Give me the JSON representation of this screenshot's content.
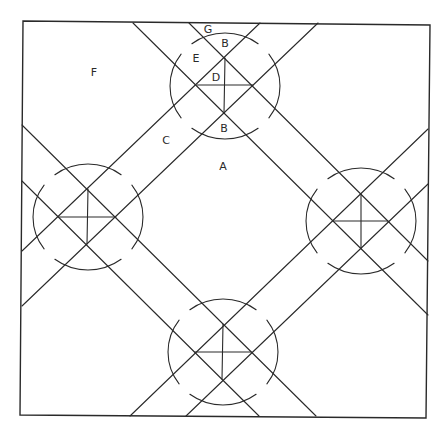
{
  "diagram": {
    "type": "quilt-block-pattern",
    "frame": [
      [
        23,
        21
      ],
      [
        430,
        25
      ],
      [
        426,
        418
      ],
      [
        20,
        415
      ]
    ],
    "stroke_color": "#2a2a2a",
    "background": "#ffffff",
    "nodes": [
      {
        "name": "top",
        "cx": 225,
        "cy": 86,
        "rx": 55,
        "ry": 53,
        "diamond": {
          "top": [
            225,
            58
          ],
          "left": [
            197,
            85
          ],
          "right": [
            253,
            85
          ],
          "bottom": [
            224,
            113
          ]
        }
      },
      {
        "name": "left",
        "cx": 88,
        "cy": 217,
        "rx": 55,
        "ry": 53,
        "diamond": {
          "top": [
            88,
            189
          ],
          "left": [
            59,
            217
          ],
          "right": [
            116,
            217
          ],
          "bottom": [
            87,
            244
          ]
        }
      },
      {
        "name": "right",
        "cx": 361,
        "cy": 221,
        "rx": 55,
        "ry": 53,
        "diamond": {
          "top": [
            361,
            194
          ],
          "left": [
            333,
            221
          ],
          "right": [
            388,
            221
          ],
          "bottom": [
            361,
            248
          ]
        }
      },
      {
        "name": "bottom",
        "cx": 223,
        "cy": 352,
        "rx": 55,
        "ry": 53,
        "diamond": {
          "top": [
            223,
            324
          ],
          "left": [
            195,
            352
          ],
          "right": [
            251,
            352
          ],
          "bottom": [
            222,
            379
          ]
        }
      }
    ],
    "band_lines": [
      {
        "band": "upper-right-backslash",
        "from": [
          189,
          23
        ],
        "to": [
          428,
          261
        ]
      },
      {
        "band": "upper-right-backslash",
        "from": [
          133,
          23
        ],
        "to": [
          428,
          315
        ]
      },
      {
        "band": "lower-left-backslash",
        "from": [
          22,
          125
        ],
        "to": [
          316,
          416
        ]
      },
      {
        "band": "lower-left-backslash",
        "from": [
          22,
          181
        ],
        "to": [
          259,
          416
        ]
      },
      {
        "band": "upper-left-slash",
        "from": [
          22,
          251
        ],
        "to": [
          260,
          23
        ]
      },
      {
        "band": "upper-left-slash",
        "from": [
          22,
          306
        ],
        "to": [
          318,
          23
        ]
      },
      {
        "band": "lower-right-slash",
        "from": [
          130,
          416
        ],
        "to": [
          428,
          129
        ]
      },
      {
        "band": "lower-right-slash",
        "from": [
          186,
          416
        ],
        "to": [
          428,
          184
        ]
      }
    ],
    "labels": [
      {
        "id": "label-g",
        "text": "G",
        "x": 208,
        "y": 29
      },
      {
        "id": "label-b-top",
        "text": "B",
        "x": 225,
        "y": 43
      },
      {
        "id": "label-e",
        "text": "E",
        "x": 196,
        "y": 58
      },
      {
        "id": "label-d",
        "text": "D",
        "x": 216,
        "y": 77
      },
      {
        "id": "label-f",
        "text": "F",
        "x": 94,
        "y": 72
      },
      {
        "id": "label-b-bottom",
        "text": "B",
        "x": 224,
        "y": 128
      },
      {
        "id": "label-c",
        "text": "C",
        "x": 166,
        "y": 140
      },
      {
        "id": "label-a",
        "text": "A",
        "x": 223,
        "y": 166
      }
    ]
  }
}
